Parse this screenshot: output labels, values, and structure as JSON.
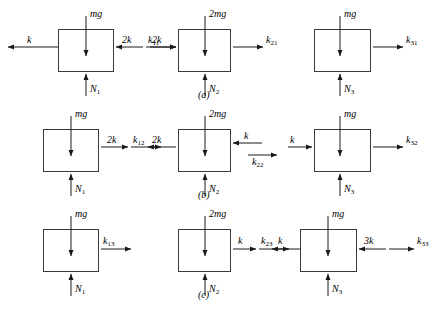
{
  "figure": {
    "background_color": "#ffffff",
    "stroke_color": "#3a3a3a",
    "rows": [
      {
        "id": "a",
        "row_label": "(a)",
        "blocks": [
          {
            "name": "block-1",
            "weight": "mg",
            "normal": "N",
            "normal_sub": "1",
            "left_labels": [
              "k"
            ],
            "right_labels": [
              "2k",
              "k"
            ],
            "right_subs": [
              "",
              "11"
            ]
          },
          {
            "name": "block-2",
            "weight": "2mg",
            "normal": "N",
            "normal_sub": "2",
            "left_labels": [
              "2k"
            ],
            "right_labels": [
              "k"
            ],
            "right_subs": [
              "21"
            ]
          },
          {
            "name": "block-3",
            "weight": "mg",
            "normal": "N",
            "normal_sub": "3",
            "left_labels": [],
            "right_labels": [
              "k"
            ],
            "right_subs": [
              "31"
            ]
          }
        ]
      },
      {
        "id": "b",
        "row_label": "(b)",
        "blocks": [
          {
            "name": "block-1",
            "weight": "mg",
            "normal": "N",
            "normal_sub": "1",
            "left_labels": [],
            "right_labels": [
              "2k",
              "k"
            ],
            "right_subs": [
              "",
              "12"
            ]
          },
          {
            "name": "block-2",
            "weight": "2mg",
            "normal": "N",
            "normal_sub": "2",
            "left_labels": [
              "2k"
            ],
            "right_labels": [
              "k",
              "k"
            ],
            "right_subs": [
              "",
              "22"
            ]
          },
          {
            "name": "block-3",
            "weight": "mg",
            "normal": "N",
            "normal_sub": "3",
            "left_labels": [
              "k"
            ],
            "right_labels": [
              "k"
            ],
            "right_subs": [
              "32"
            ]
          }
        ]
      },
      {
        "id": "c",
        "row_label": "(c)",
        "blocks": [
          {
            "name": "block-1",
            "weight": "mg",
            "normal": "N",
            "normal_sub": "1",
            "left_labels": [],
            "right_labels": [
              "k"
            ],
            "right_subs": [
              "13"
            ]
          },
          {
            "name": "block-2",
            "weight": "2mg",
            "normal": "N",
            "normal_sub": "2",
            "left_labels": [],
            "right_labels": [
              "k",
              "k"
            ],
            "right_subs": [
              "",
              "23"
            ]
          },
          {
            "name": "block-3",
            "weight": "mg",
            "normal": "N",
            "normal_sub": "3",
            "left_labels": [
              "k"
            ],
            "right_labels": [
              "3k",
              "k"
            ],
            "right_subs": [
              "",
              "33"
            ]
          }
        ]
      }
    ]
  },
  "labels": {
    "a_mg": "mg",
    "a_2mg": "2mg",
    "a_N1": "N",
    "a_N1s": "1",
    "a_N2": "N",
    "a_N2s": "2",
    "a_N3": "N",
    "a_N3s": "3",
    "a_k_left1": "k",
    "a_2k_r1": "2k",
    "a_k11": "k",
    "a_k11s": "11",
    "a_2k_l2": "2k",
    "a_k21": "k",
    "a_k21s": "21",
    "a_mg3": "mg",
    "a_k31": "k",
    "a_k31s": "31",
    "a_row": "(a)",
    "b_mg": "mg",
    "b_2k_r1": "2k",
    "b_k12": "k",
    "b_k12s": "12",
    "b_N1": "N",
    "b_N1s": "1",
    "b_2k_l2": "2k",
    "b_2mg": "2mg",
    "b_k_r2": "k",
    "b_k22": "k",
    "b_k22s": "22",
    "b_N2": "N",
    "b_N2s": "2",
    "b_k_l3": "k",
    "b_mg3": "mg",
    "b_k32": "k",
    "b_k32s": "32",
    "b_N3": "N",
    "b_N3s": "3",
    "b_row": "(b)",
    "c_mg": "mg",
    "c_k13": "k",
    "c_k13s": "13",
    "c_N1": "N",
    "c_N1s": "1",
    "c_2mg": "2mg",
    "c_k_r2": "k",
    "c_k23": "k",
    "c_k23s": "23",
    "c_N2": "N",
    "c_N2s": "2",
    "c_k_l3": "k",
    "c_mg3": "mg",
    "c_3k": "3k",
    "c_k33": "k",
    "c_k33s": "33",
    "c_N3": "N",
    "c_N3s": "3",
    "c_row": "(c)"
  }
}
